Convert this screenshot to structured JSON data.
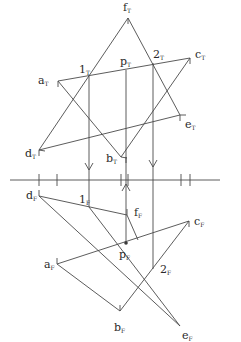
{
  "diagram": {
    "ground_line": {
      "x1": 10,
      "x2": 220,
      "y": 180
    },
    "top_view": {
      "labels": [
        {
          "id": "fT",
          "base": "f",
          "sub": "T",
          "x": 123,
          "y": 11
        },
        {
          "id": "aT",
          "base": "a",
          "sub": "T",
          "x": 38,
          "y": 84
        },
        {
          "id": "1T",
          "base": "1",
          "sub": "T",
          "x": 79,
          "y": 73
        },
        {
          "id": "pT",
          "base": "p",
          "sub": "T",
          "x": 120,
          "y": 65
        },
        {
          "id": "2T",
          "base": "2",
          "sub": "T",
          "x": 153,
          "y": 58
        },
        {
          "id": "cT",
          "base": "c",
          "sub": "T",
          "x": 195,
          "y": 58
        },
        {
          "id": "eT",
          "base": "e",
          "sub": "T",
          "x": 185,
          "y": 128
        },
        {
          "id": "dT",
          "base": "d",
          "sub": "T",
          "x": 25,
          "y": 157
        },
        {
          "id": "bT",
          "base": "b",
          "sub": "T",
          "x": 106,
          "y": 162
        }
      ]
    },
    "front_view": {
      "labels": [
        {
          "id": "dF",
          "base": "d",
          "sub": "F",
          "x": 26,
          "y": 199
        },
        {
          "id": "1F",
          "base": "1",
          "sub": "F",
          "x": 79,
          "y": 203
        },
        {
          "id": "fF",
          "base": "f",
          "sub": "F",
          "x": 134,
          "y": 216
        },
        {
          "id": "cF",
          "base": "c",
          "sub": "F",
          "x": 194,
          "y": 225
        },
        {
          "id": "pF",
          "base": "p",
          "sub": "F",
          "x": 119,
          "y": 258
        },
        {
          "id": "aF",
          "base": "a",
          "sub": "F",
          "x": 44,
          "y": 268
        },
        {
          "id": "2F",
          "base": "2",
          "sub": "F",
          "x": 160,
          "y": 273
        },
        {
          "id": "bF",
          "base": "b",
          "sub": "F",
          "x": 114,
          "y": 331
        },
        {
          "id": "eF",
          "base": "e",
          "sub": "F",
          "x": 182,
          "y": 339
        }
      ]
    }
  }
}
